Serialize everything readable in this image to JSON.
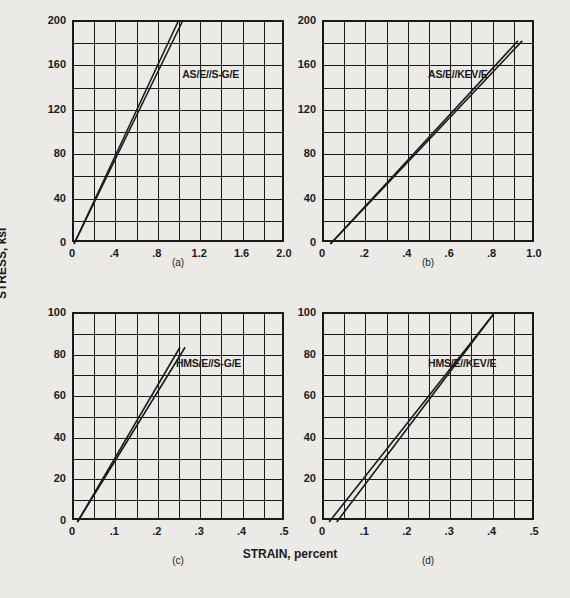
{
  "figure": {
    "axis_titles": {
      "y": "STRESS, ksi",
      "x": "STRAIN, percent"
    },
    "ink_color": "#1a1a1a",
    "background_color": "#ebeae6"
  },
  "chart_data": [
    {
      "type": "line",
      "panel": "(a)",
      "title": "AS/E//S-G/E",
      "xlabel": "STRAIN, percent",
      "ylabel": "STRESS, ksi",
      "xlim": [
        0,
        2.0
      ],
      "ylim": [
        0,
        200
      ],
      "xticks": [
        0,
        0.4,
        0.8,
        1.2,
        1.6,
        2.0
      ],
      "xticklabels": [
        "0",
        ".4",
        ".8",
        "1.2",
        "1.6",
        "2.0"
      ],
      "yticks": [
        0,
        40,
        80,
        120,
        160,
        200
      ],
      "yticklabels": [
        "0",
        "40",
        "80",
        "120",
        "160",
        "200"
      ],
      "x_minor_divisions": 10,
      "y_minor_divisions": 10,
      "grid": true,
      "legend": "none",
      "series": [
        {
          "name": "loading",
          "x": [
            0.0,
            1.02
          ],
          "y": [
            0,
            200
          ]
        },
        {
          "name": "unloading",
          "x": [
            0.0,
            0.98
          ],
          "y": [
            0,
            200
          ]
        }
      ]
    },
    {
      "type": "line",
      "panel": "(b)",
      "title": "AS/E//KEV/E",
      "xlabel": "STRAIN, percent",
      "ylabel": "STRESS, ksi",
      "xlim": [
        0,
        1.0
      ],
      "ylim": [
        0,
        200
      ],
      "xticks": [
        0,
        0.2,
        0.4,
        0.6,
        0.8,
        1.0
      ],
      "xticklabels": [
        "0",
        ".2",
        ".4",
        ".6",
        ".8",
        "1.0"
      ],
      "yticks": [
        0,
        40,
        80,
        120,
        160,
        200
      ],
      "yticklabels": [
        "0",
        "40",
        "80",
        "120",
        "160",
        "200"
      ],
      "x_minor_divisions": 10,
      "y_minor_divisions": 10,
      "grid": true,
      "legend": "none",
      "series": [
        {
          "name": "loading",
          "x": [
            0.03,
            0.935
          ],
          "y": [
            0,
            183
          ]
        },
        {
          "name": "unloading",
          "x": [
            0.03,
            0.915
          ],
          "y": [
            0,
            183
          ]
        }
      ]
    },
    {
      "type": "line",
      "panel": "(c)",
      "title": "HMS/E//S-G/E",
      "xlabel": "STRAIN, percent",
      "ylabel": "STRESS, ksi",
      "xlim": [
        0,
        0.5
      ],
      "ylim": [
        0,
        100
      ],
      "xticks": [
        0,
        0.1,
        0.2,
        0.3,
        0.4,
        0.5
      ],
      "xticklabels": [
        "0",
        ".1",
        ".2",
        ".3",
        ".4",
        ".5"
      ],
      "yticks": [
        0,
        20,
        40,
        60,
        80,
        100
      ],
      "yticklabels": [
        "0",
        "20",
        "40",
        "60",
        "80",
        "100"
      ],
      "x_minor_divisions": 10,
      "y_minor_divisions": 10,
      "grid": true,
      "legend": "none",
      "series": [
        {
          "name": "loading",
          "x": [
            0.008,
            0.262
          ],
          "y": [
            0,
            84
          ]
        },
        {
          "name": "unloading",
          "x": [
            0.008,
            0.25
          ],
          "y": [
            0,
            84
          ]
        }
      ]
    },
    {
      "type": "line",
      "panel": "(d)",
      "title": "HMS/E//KEV/E",
      "xlabel": "STRAIN, percent",
      "ylabel": "STRESS, ksi",
      "xlim": [
        0,
        0.5
      ],
      "ylim": [
        0,
        100
      ],
      "xticks": [
        0,
        0.1,
        0.2,
        0.3,
        0.4,
        0.5
      ],
      "xticklabels": [
        "0",
        ".1",
        ".2",
        ".3",
        ".4",
        ".5"
      ],
      "yticks": [
        0,
        20,
        40,
        60,
        80,
        100
      ],
      "yticklabels": [
        "0",
        "20",
        "40",
        "60",
        "80",
        "100"
      ],
      "x_minor_divisions": 10,
      "y_minor_divisions": 10,
      "grid": true,
      "legend": "none",
      "series": [
        {
          "name": "loading",
          "x": [
            0.012,
            0.4
          ],
          "y": [
            0,
            100
          ]
        },
        {
          "name": "unloading",
          "x": [
            0.03,
            0.4
          ],
          "y": [
            0,
            100
          ]
        }
      ]
    }
  ]
}
